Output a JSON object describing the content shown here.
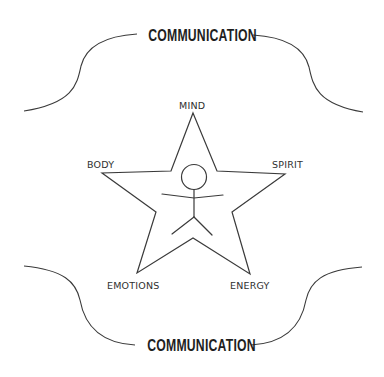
{
  "diagram": {
    "top_heading": "COMMUNICATION",
    "bottom_heading": "COMMUNICATION",
    "star": {
      "center_figure": "stick-figure",
      "points": {
        "top": "MIND",
        "left": "BODY",
        "right": "SPIRIT",
        "bottom_left": "EMOTIONS",
        "bottom_right": "ENERGY"
      }
    },
    "colors": {
      "line": "#3a3a3a",
      "text": "#2f2f2f",
      "heading": "#1e1e1e",
      "background": "#ffffff"
    }
  }
}
